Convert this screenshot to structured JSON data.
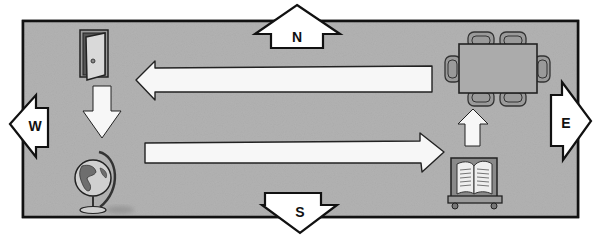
{
  "diagram": {
    "colors": {
      "floor": "#b3b3b3",
      "outline": "#111111",
      "arrow_fill": "#f7f7f7",
      "background": "#ffffff",
      "table": "#a8a8a8"
    },
    "compass": {
      "north": "N",
      "south": "S",
      "west": "W",
      "east": "E"
    },
    "objects": [
      {
        "id": "door",
        "label": "door-icon"
      },
      {
        "id": "globe",
        "label": "globe-icon"
      },
      {
        "id": "book-stand",
        "label": "book-icon"
      },
      {
        "id": "table",
        "label": "table-with-chairs-icon"
      }
    ],
    "path": [
      {
        "from": "door",
        "to": "globe",
        "direction": "south"
      },
      {
        "from": "globe",
        "to": "book-stand",
        "direction": "east"
      },
      {
        "from": "book-stand",
        "to": "table",
        "direction": "north"
      },
      {
        "from": "table",
        "to": "door",
        "direction": "west"
      }
    ]
  }
}
